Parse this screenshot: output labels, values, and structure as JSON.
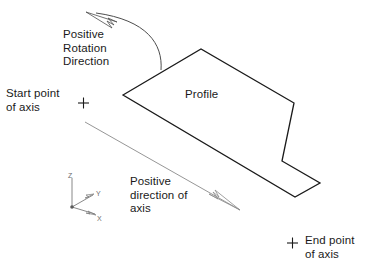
{
  "figure": {
    "background_color": "#ffffff",
    "profile_stroke_color": "#1a1a1a",
    "axis_stroke_color": "#8a8a8a",
    "rotation_stroke_color": "#4d4d4d",
    "ucs_stroke_color": "#7a7a7a",
    "text_color": "#1a1a1a"
  },
  "labels": {
    "start_point": "Start point\nof axis",
    "end_point": "End point\nof axis",
    "positive_rotation": "Positive\nRotation\nDirection",
    "positive_direction": "Positive\ndirection of\naxis",
    "profile": "Profile"
  },
  "ucs_icon": {
    "z_axis_label": "Z",
    "y_axis_label": "Y",
    "x_axis_label": "X"
  },
  "markers": {
    "start_point_crosshair": "+",
    "end_point_crosshair": "+"
  },
  "geometry": {
    "profile_polygon_points": "123,95 201,49 294,103 282,161 320,183 295,197",
    "axis_line": {
      "x1": 85,
      "y1": 122,
      "x2": 240,
      "y2": 210
    },
    "axis_arrowhead": "240,210 209,194 218,199 213,192 219,197 215,190",
    "rotation_arc_path": "M 161,70 C 163,44 147,20 96,13",
    "rotation_arrowhead": "86,12 117,22 108,18 114,25 107,21 112,28",
    "ucs_origin": {
      "x": 72,
      "y": 207
    },
    "ucs_z_end": {
      "x": 72,
      "y": 178
    },
    "ucs_y_end": {
      "x": 93,
      "y": 195
    },
    "ucs_x_end": {
      "x": 95,
      "y": 214
    },
    "start_crosshair": {
      "x": 83,
      "y": 103
    },
    "end_crosshair": {
      "x": 292,
      "y": 243
    }
  }
}
